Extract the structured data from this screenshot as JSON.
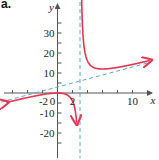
{
  "panel_label": "a.",
  "colors": {
    "curve": "#e8344e",
    "asymptote": "#5aa6d6",
    "axis": "#555555"
  },
  "chart_data": {
    "type": "line",
    "title": "",
    "function": "f(x) = x^2/(x-3)",
    "xlabel": "x",
    "ylabel": "y",
    "xlim": [
      -7,
      12.5
    ],
    "ylim": [
      -31,
      44
    ],
    "x_tick_labels": [
      "-2",
      "0",
      "2",
      "10"
    ],
    "y_tick_labels": [
      "30",
      "20",
      "10",
      "0",
      "-10",
      "-20"
    ],
    "x_ticks": [
      -6,
      -4,
      -2,
      0,
      2,
      4,
      6,
      8,
      10
    ],
    "y_ticks": [
      -25,
      -20,
      -15,
      -10,
      -5,
      0,
      5,
      10,
      15,
      20,
      25,
      30,
      35
    ],
    "grid": false,
    "series": [
      {
        "name": "f(x)",
        "style": "solid red curve with arrows",
        "x": [
          -7,
          -4,
          -2,
          -1,
          0,
          1,
          2,
          2.5,
          3.6,
          4,
          5,
          6,
          8,
          10,
          12
        ],
        "y": [
          -4.9,
          -2.29,
          -0.8,
          -0.25,
          0,
          -0.5,
          -4,
          -12.5,
          21.6,
          16,
          12.5,
          12,
          12.8,
          14.3,
          16
        ]
      },
      {
        "name": "vertical asymptote",
        "style": "dashed blue",
        "equation": "x = 3"
      },
      {
        "name": "oblique asymptote",
        "style": "dashed blue",
        "equation": "y = x + 3"
      }
    ]
  }
}
